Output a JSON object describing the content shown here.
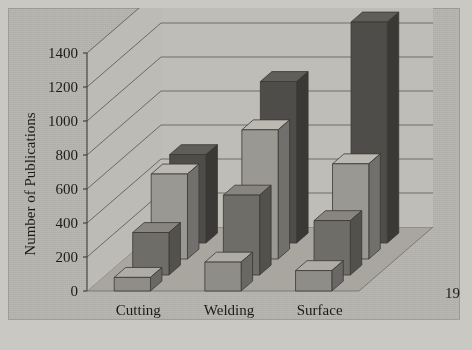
{
  "figure": {
    "background_color": "#cac8c3",
    "panel_color": "#b9b7b1"
  },
  "chart_data": {
    "type": "bar",
    "subtype": "3d-grouped-column",
    "title": "",
    "xlabel": "",
    "ylabel": "Number of Publications",
    "ylim": [
      0,
      1400
    ],
    "yticks": [
      0,
      200,
      400,
      600,
      800,
      1000,
      1200,
      1400
    ],
    "ytick_labels": [
      "0",
      "200",
      "400",
      "600",
      "800",
      "1000",
      "1200",
      "1400"
    ],
    "grid": true,
    "legend_position": "depth-axis-right",
    "categories": [
      "Cutting",
      "Welding",
      "Surface Modification"
    ],
    "category_labels": [
      {
        "line1": "Cutting",
        "line2": ""
      },
      {
        "line1": "Welding",
        "line2": ""
      },
      {
        "line1": "Surface",
        "line2": "Modification"
      }
    ],
    "series": [
      {
        "name": "1980-82",
        "values": [
          80,
          170,
          120
        ],
        "color": "#8f8d87"
      },
      {
        "name": "1983-85",
        "values": [
          250,
          470,
          320
        ],
        "color": "#6f6d67"
      },
      {
        "name": "1986-88",
        "values": [
          500,
          760,
          560
        ],
        "color": "#9a9892"
      },
      {
        "name": "1989-91",
        "values": [
          520,
          950,
          1300
        ],
        "color": "#4f4d49"
      }
    ],
    "series_labels": [
      "1989-91",
      "1986-88",
      "1983-85",
      "1980-82"
    ]
  },
  "axis": {
    "y_title": "Number of Publications"
  }
}
